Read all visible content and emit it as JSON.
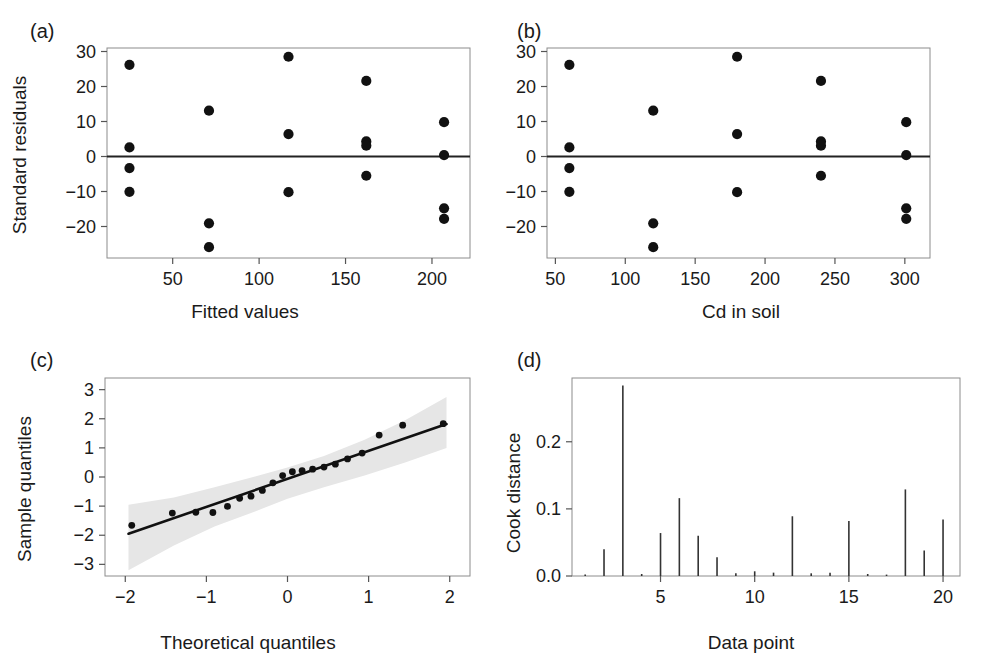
{
  "figure": {
    "width": 986,
    "height": 662,
    "background": "#ffffff",
    "marker_color": "#111111",
    "band_color": "#e6e6e6",
    "frame_color": "#8c8c8c"
  },
  "panels": {
    "a": {
      "letter": "(a)"
    },
    "b": {
      "letter": "(b)"
    },
    "c": {
      "letter": "(c)"
    },
    "d": {
      "letter": "(d)"
    }
  },
  "chart_data": [
    {
      "panel": "a",
      "type": "scatter",
      "title": "",
      "xlabel": "Fitted values",
      "ylabel": "Standard residuals",
      "xlim": [
        12,
        222
      ],
      "ylim": [
        -29,
        31
      ],
      "xticks": [
        50,
        100,
        150,
        200
      ],
      "xtick_labels": [
        "50",
        "100",
        "150",
        "200"
      ],
      "yticks": [
        -20,
        -10,
        0,
        10,
        20,
        30
      ],
      "ytick_labels": [
        "−20",
        "−10",
        "0",
        "10",
        "20",
        "30"
      ],
      "grid": false,
      "legend": "none",
      "reference_line_y": 0,
      "points": [
        {
          "x": 25,
          "y": 26.2
        },
        {
          "x": 25,
          "y": 2.6
        },
        {
          "x": 25,
          "y": -3.3
        },
        {
          "x": 25,
          "y": -10.1
        },
        {
          "x": 71,
          "y": 13.1
        },
        {
          "x": 71,
          "y": -19.1
        },
        {
          "x": 71,
          "y": -25.9
        },
        {
          "x": 117,
          "y": 28.5
        },
        {
          "x": 117,
          "y": 6.4
        },
        {
          "x": 117,
          "y": -10.2
        },
        {
          "x": 162,
          "y": 21.6
        },
        {
          "x": 162,
          "y": 4.3
        },
        {
          "x": 162,
          "y": 3.1
        },
        {
          "x": 162,
          "y": -5.5
        },
        {
          "x": 207,
          "y": 9.8
        },
        {
          "x": 207,
          "y": 0.4
        },
        {
          "x": 207,
          "y": -14.8
        },
        {
          "x": 207,
          "y": -17.8
        }
      ]
    },
    {
      "panel": "b",
      "type": "scatter",
      "title": "",
      "xlabel": "Cd in soil",
      "ylabel": "Standard residuals",
      "xlim": [
        44,
        318
      ],
      "ylim": [
        -29,
        31
      ],
      "xticks": [
        50,
        100,
        150,
        200,
        250,
        300
      ],
      "xtick_labels": [
        "50",
        "100",
        "150",
        "200",
        "250",
        "300"
      ],
      "yticks": [
        -20,
        -10,
        0,
        10,
        20,
        30
      ],
      "ytick_labels": [
        "−20",
        "−10",
        "0",
        "10",
        "20",
        "30"
      ],
      "grid": false,
      "legend": "none",
      "reference_line_y": 0,
      "points": [
        {
          "x": 60,
          "y": 26.2
        },
        {
          "x": 60,
          "y": 2.6
        },
        {
          "x": 60,
          "y": -3.3
        },
        {
          "x": 60,
          "y": -10.1
        },
        {
          "x": 120,
          "y": 13.1
        },
        {
          "x": 120,
          "y": -19.1
        },
        {
          "x": 120,
          "y": -25.9
        },
        {
          "x": 180,
          "y": 28.5
        },
        {
          "x": 180,
          "y": 6.4
        },
        {
          "x": 180,
          "y": -10.2
        },
        {
          "x": 240,
          "y": 21.6
        },
        {
          "x": 240,
          "y": 4.3
        },
        {
          "x": 240,
          "y": 3.1
        },
        {
          "x": 240,
          "y": -5.5
        },
        {
          "x": 301,
          "y": 9.8
        },
        {
          "x": 301,
          "y": 0.4
        },
        {
          "x": 301,
          "y": -14.8
        },
        {
          "x": 301,
          "y": -17.8
        }
      ]
    },
    {
      "panel": "c",
      "type": "scatter",
      "title": "",
      "xlabel": "Theoretical quantiles",
      "ylabel": "Sample quantiles",
      "xlim": [
        -2.25,
        2.25
      ],
      "ylim": [
        -3.4,
        3.4
      ],
      "xticks": [
        -2,
        -1,
        0,
        1,
        2
      ],
      "xtick_labels": [
        "−2",
        "−1",
        "0",
        "1",
        "2"
      ],
      "yticks": [
        -3,
        -2,
        -1,
        0,
        1,
        2,
        3
      ],
      "ytick_labels": [
        "−3",
        "−2",
        "−1",
        "0",
        "1",
        "2",
        "3"
      ],
      "grid": false,
      "legend": "none",
      "reference_line": {
        "x1": -1.96,
        "y1": -1.95,
        "x2": 1.96,
        "y2": 1.82
      },
      "confidence_band": {
        "upper": [
          {
            "x": -1.96,
            "y": -0.95
          },
          {
            "x": -1.4,
            "y": -0.7
          },
          {
            "x": -0.9,
            "y": -0.35
          },
          {
            "x": -0.4,
            "y": 0.02
          },
          {
            "x": 0.0,
            "y": 0.33
          },
          {
            "x": 0.45,
            "y": 0.72
          },
          {
            "x": 0.95,
            "y": 1.28
          },
          {
            "x": 1.45,
            "y": 1.95
          },
          {
            "x": 1.96,
            "y": 2.75
          }
        ],
        "lower": [
          {
            "x": -1.96,
            "y": -3.2
          },
          {
            "x": -1.4,
            "y": -2.35
          },
          {
            "x": -0.9,
            "y": -1.7
          },
          {
            "x": -0.4,
            "y": -1.18
          },
          {
            "x": 0.0,
            "y": -0.75
          },
          {
            "x": 0.45,
            "y": -0.35
          },
          {
            "x": 0.95,
            "y": 0.05
          },
          {
            "x": 1.45,
            "y": 0.5
          },
          {
            "x": 1.96,
            "y": 1.0
          }
        ]
      },
      "points": [
        {
          "x": -1.92,
          "y": -1.66
        },
        {
          "x": -1.42,
          "y": -1.24
        },
        {
          "x": -1.13,
          "y": -1.21
        },
        {
          "x": -0.92,
          "y": -1.22
        },
        {
          "x": -0.74,
          "y": -1.01
        },
        {
          "x": -0.59,
          "y": -0.73
        },
        {
          "x": -0.45,
          "y": -0.66
        },
        {
          "x": -0.31,
          "y": -0.46
        },
        {
          "x": -0.18,
          "y": -0.2
        },
        {
          "x": -0.06,
          "y": 0.05
        },
        {
          "x": 0.06,
          "y": 0.18
        },
        {
          "x": 0.18,
          "y": 0.22
        },
        {
          "x": 0.31,
          "y": 0.27
        },
        {
          "x": 0.45,
          "y": 0.34
        },
        {
          "x": 0.59,
          "y": 0.44
        },
        {
          "x": 0.74,
          "y": 0.62
        },
        {
          "x": 0.92,
          "y": 0.82
        },
        {
          "x": 1.13,
          "y": 1.44
        },
        {
          "x": 1.42,
          "y": 1.78
        },
        {
          "x": 1.92,
          "y": 1.83
        }
      ]
    },
    {
      "panel": "d",
      "type": "bar",
      "title": "",
      "xlabel": "Data point",
      "ylabel": "Cook distance",
      "xlim": [
        0.3,
        20.9
      ],
      "ylim": [
        0,
        0.295
      ],
      "xticks": [
        5,
        10,
        15,
        20
      ],
      "xtick_labels": [
        "5",
        "10",
        "15",
        "20"
      ],
      "yticks": [
        0.0,
        0.1,
        0.2
      ],
      "ytick_labels": [
        "0.0",
        "0.1",
        "0.2"
      ],
      "grid": false,
      "legend": "none",
      "categories": [
        1,
        2,
        3,
        4,
        5,
        6,
        7,
        8,
        9,
        10,
        11,
        12,
        13,
        14,
        15,
        16,
        17,
        18,
        19,
        20
      ],
      "values": [
        0.002,
        0.04,
        0.284,
        0.003,
        0.064,
        0.116,
        0.06,
        0.028,
        0.004,
        0.007,
        0.005,
        0.089,
        0.004,
        0.005,
        0.082,
        0.003,
        0.001,
        0.129,
        0.038,
        0.084
      ]
    }
  ]
}
